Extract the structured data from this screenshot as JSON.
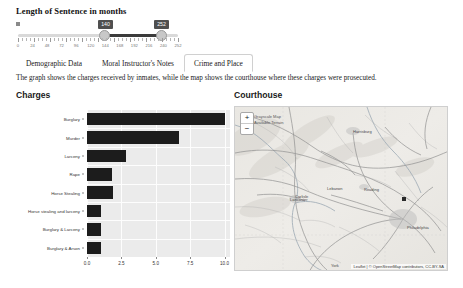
{
  "slider": {
    "title": "Length of Sentence in months",
    "icon": "drag-handle-icon",
    "min_value": "140",
    "max_value": "252",
    "tick_labels": [
      "0",
      "24",
      "48",
      "72",
      "96",
      "120",
      "144",
      "168",
      "192",
      "216",
      "240",
      "252"
    ],
    "range_min": 0,
    "range_max": 252
  },
  "tabs": [
    {
      "label": "Demographic Data",
      "active": false
    },
    {
      "label": "Moral Instructor's Notes",
      "active": false
    },
    {
      "label": "Crime and Place",
      "active": true
    }
  ],
  "description": "The graph shows the charges received by inmates, while the map shows the courthouse where these charges were prosecuted.",
  "charges_panel": {
    "title": "Charges"
  },
  "courthouse_panel": {
    "title": "Courthouse"
  },
  "map": {
    "zoom_in_label": "+",
    "zoom_out_label": "−",
    "layer_labels": [
      "Grayscale Map",
      "Available Terrain"
    ],
    "attribution": "Leaflet | © OpenStreetMap contributors, CC-BY-SA",
    "city_labels": [
      {
        "name": "Harrisburg",
        "x": 118,
        "y": 22
      },
      {
        "name": "Lebanon",
        "x": 92,
        "y": 79
      },
      {
        "name": "Reading",
        "x": 129,
        "y": 80
      },
      {
        "name": "Carlisle",
        "x": 60,
        "y": 87
      },
      {
        "name": "Lancaster",
        "x": 55,
        "y": 90
      },
      {
        "name": "Philadelphia",
        "x": 172,
        "y": 118
      },
      {
        "name": "York",
        "x": 96,
        "y": 156
      }
    ],
    "marker": {
      "x": 167,
      "y": 90
    }
  },
  "chart_data": {
    "type": "bar",
    "orientation": "horizontal",
    "title": "Charges",
    "xlabel": "",
    "ylabel": "",
    "xlim": [
      0,
      10.4
    ],
    "xticks": [
      "0.0",
      "2.5",
      "5.0",
      "7.5",
      "10.0"
    ],
    "xtick_values": [
      0,
      2.5,
      5,
      7.5,
      10
    ],
    "grid": true,
    "categories": [
      "Burglary",
      "Murder",
      "Larceny",
      "Rape",
      "Horse Stealing",
      "Horse stealing and larceny",
      "Burglary & Larceny",
      "Burglary & Arson"
    ],
    "values": [
      10,
      6.7,
      2.8,
      1.8,
      1.9,
      1.0,
      1.0,
      1.0
    ],
    "bar_color": "#1c1c1c"
  }
}
